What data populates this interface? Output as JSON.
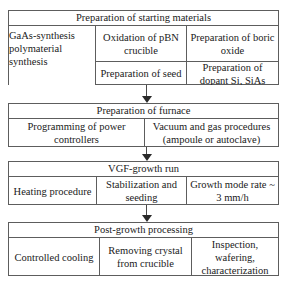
{
  "diagram": {
    "orientation": "vertical",
    "stage_count": 4,
    "arrow_count": 3,
    "colors": {
      "border": "#5d5d5d",
      "arrow": "#2a2a2a",
      "background": "#ffffff",
      "text": "#1a1a1a"
    },
    "stages": [
      {
        "id": "preparation-of-starting-materials",
        "title": "Preparation of starting materials",
        "rows": [
          {
            "cells": [
              "GaAs-synthesis polymaterial synthesis",
              "Oxidation of pBN crucible",
              "Preparation of boric oxide"
            ]
          },
          {
            "cells": [
              "",
              "Preparation of seed",
              "Preparation of dopant Si, SiAs"
            ]
          }
        ],
        "cells_flat": [
          "GaAs-synthesis polymaterial synthesis",
          "Oxidation of pBN crucible",
          "Preparation of boric oxide",
          "Preparation of seed",
          "Preparation of dopant Si, SiAs"
        ]
      },
      {
        "id": "preparation-of-furnace",
        "title": "Preparation of furnace",
        "rows": [
          {
            "cells": [
              "Programming of power controllers",
              "Vacuum and gas procedures (ampoule or autoclave)"
            ]
          }
        ],
        "cells_flat": [
          "Programming of power controllers",
          "Vacuum and gas procedures (ampoule or autoclave)"
        ]
      },
      {
        "id": "vgf-growth-run",
        "title": "VGF-growth run",
        "rows": [
          {
            "cells": [
              "Heating procedure",
              "Stabilization and seeding",
              "Growth mode rate ~ 3 mm/h"
            ]
          }
        ],
        "cells_flat": [
          "Heating procedure",
          "Stabilization and seeding",
          "Growth mode rate ~ 3 mm/h"
        ]
      },
      {
        "id": "post-growth-processing",
        "title": "Post-growth processing",
        "rows": [
          {
            "cells": [
              "Controlled cooling",
              "Removing crystal from crucible",
              "Inspection, wafering, characterization"
            ]
          }
        ],
        "cells_flat": [
          "Controlled cooling",
          "Removing crystal from crucible",
          "Inspection, wafering, characterization"
        ]
      }
    ],
    "arrows": [
      {
        "id": "arrow-materials-to-furnace",
        "from": "preparation-of-starting-materials",
        "to": "preparation-of-furnace",
        "direction": "down"
      },
      {
        "id": "arrow-furnace-to-growth",
        "from": "preparation-of-furnace",
        "to": "vgf-growth-run",
        "direction": "down"
      },
      {
        "id": "arrow-growth-to-post",
        "from": "vgf-growth-run",
        "to": "post-growth-processing",
        "direction": "down"
      }
    ]
  }
}
